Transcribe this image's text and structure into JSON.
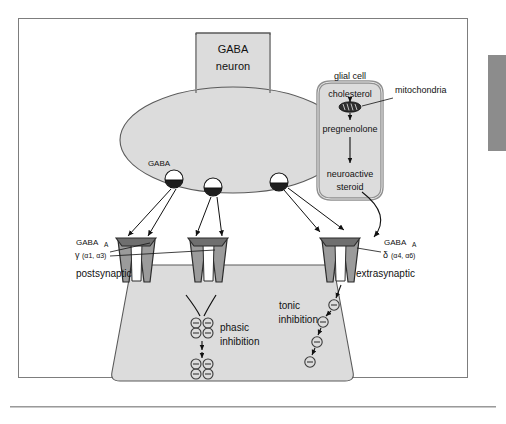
{
  "figure": {
    "title_text": "",
    "neuron": {
      "label_line1": "GABA",
      "label_line2": "neuron"
    },
    "vesicle_label": "GABA",
    "glial": {
      "title": "glial cell",
      "step1": "cholesterol",
      "organelle": "mitochondria",
      "step2": "pregnenolone",
      "step3_line1": "neuroactive",
      "step3_line2": "steroid"
    },
    "receptors": {
      "synaptic": {
        "name": "GABA",
        "subscript": "A",
        "subunit_glyph": "γ",
        "alphas": "(α1, α3)",
        "location": "postsynaptic"
      },
      "extrasynaptic": {
        "name": "GABA",
        "subscript": "A",
        "subunit_glyph": "δ",
        "alphas": "(α4, α6)",
        "location": "extrasynaptic"
      }
    },
    "inhibition": {
      "phasic_line1": "phasic",
      "phasic_line2": "inhibition",
      "tonic_line1": "tonic",
      "tonic_line2": "inhibition"
    },
    "colors": {
      "cell_fill": "#dcdcdc",
      "cell_stroke": "#5a5a5a",
      "glial_stroke": "#8f8f8f",
      "receptor_fill": "#9b9b9b",
      "receptor_stroke": "#2b2b2b",
      "frame_stroke": "#7d7d7d",
      "side_tab": "#8c8c8c",
      "arrow": "#111111",
      "text": "#111111"
    }
  }
}
